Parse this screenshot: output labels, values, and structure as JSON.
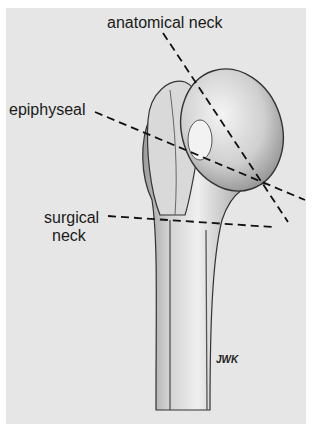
{
  "figure": {
    "background": "#e6e6e6",
    "line_color": "#1a1a1a",
    "labels": [
      {
        "id": "anatomical",
        "text": "anatomical neck"
      },
      {
        "id": "epiphyseal",
        "text": "epiphyseal"
      },
      {
        "id": "surgical_1",
        "text": "surgical"
      },
      {
        "id": "surgical_2",
        "text": "neck"
      }
    ],
    "signature": "JWK"
  }
}
